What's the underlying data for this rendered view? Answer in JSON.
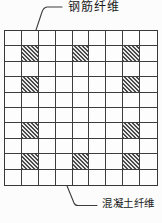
{
  "diagram": {
    "kind": "fiber-arrangement-grid",
    "labels": {
      "steel_fiber": "钢筋纤维",
      "concrete_fiber": "混凝土纤维"
    },
    "grid": {
      "rows": 10,
      "cols": 9,
      "hatched_cells": [
        [
          2,
          2
        ],
        [
          2,
          5
        ],
        [
          2,
          8
        ],
        [
          4,
          2
        ],
        [
          4,
          8
        ],
        [
          7,
          2
        ],
        [
          7,
          8
        ],
        [
          9,
          2
        ],
        [
          9,
          5
        ],
        [
          9,
          8
        ]
      ],
      "hatch_style": "diagonal-45deg"
    },
    "colors": {
      "background": "#fcfcfc",
      "line": "#3d3d3d",
      "line_strong": "#383838",
      "hatch_dark": "#4a4a4a",
      "hatch_light": "#e9e9e9",
      "text": "#1a1a1a"
    }
  }
}
